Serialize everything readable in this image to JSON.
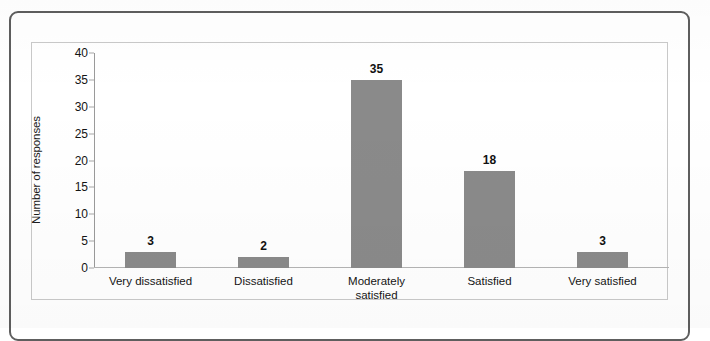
{
  "chart_data": {
    "type": "bar",
    "title": "",
    "xlabel": "",
    "ylabel": "Number of responses",
    "categories": [
      "Very dissatisfied",
      "Dissatisfied",
      "Moderately satisfied",
      "Satisfied",
      "Very satisfied"
    ],
    "category_lines": [
      [
        "Very dissatisfied"
      ],
      [
        "Dissatisfied"
      ],
      [
        "Moderately",
        "satisfied"
      ],
      [
        "Satisfied"
      ],
      [
        "Very satisfied"
      ]
    ],
    "values": [
      3,
      2,
      35,
      18,
      3
    ],
    "value_labels": [
      "3",
      "2",
      "35",
      "18",
      "3"
    ],
    "ylim": [
      0,
      40
    ],
    "ytick_values": [
      0,
      5,
      10,
      15,
      20,
      25,
      30,
      35,
      40
    ],
    "ytick_labels": [
      "0",
      "5",
      "10",
      "15",
      "20",
      "25",
      "30",
      "35",
      "40"
    ],
    "grid": false,
    "legend": false,
    "bar_color": "#8a8a8a",
    "axis_color": "#9a9a9a",
    "plot_border_color": "#c9c9c9",
    "frame_color": "#5e5e5e",
    "background_color": "#ffffff",
    "text_color": "#141414"
  }
}
